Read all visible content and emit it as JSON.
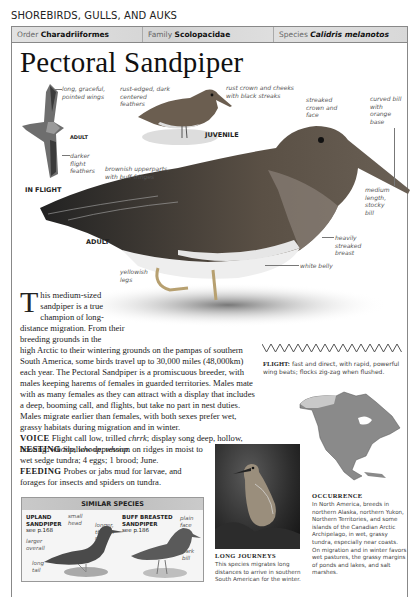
{
  "page": {
    "section_title": "SHOREBIRDS, GULLS, AND AUKS",
    "taxonomy": {
      "order_label": "Order",
      "order_value": "Charadriiformes",
      "family_label": "Family",
      "family_value": "Scolopacidae",
      "species_label": "Species",
      "species_value": "Calidris melanotos"
    },
    "species_name": "Pectoral Sandpiper"
  },
  "illustrations": {
    "flight": {
      "caption": "IN FLIGHT",
      "age": "ADULT",
      "labels": [
        "long, graceful, pointed wings",
        "darker flight feathers"
      ]
    },
    "juvenile": {
      "caption": "JUVENILE",
      "labels": [
        "rust-edged, dark centered feathers",
        "rust crown and cheeks with black streaks"
      ]
    },
    "adult": {
      "caption": "ADULT",
      "labels": {
        "upperparts": "brownish upperparts, with buff fringes",
        "crown": "streaked crown and face",
        "bill_color": "curved bill with orange base",
        "bill_shape": "medium length, stocky bill",
        "breast": "heavily streaked breast",
        "belly": "white belly",
        "legs": "yellowish legs"
      }
    }
  },
  "description": {
    "dropcap": "T",
    "intro_narrow": "his medium-sized sandpiper is a true champion of long-distance migration. From their breeding grounds in the",
    "intro_wide": "high Arctic to their wintering grounds on the pampas of southern South America, some birds travel up to 30,000 miles (48,000km) each year. The Pectoral Sandpiper is a promiscuous breeder, with males keeping harems of females in guarded territories. Males mate with as many females as they can attract with a display that includes a deep, booming call, and flights, but take no part in nest duties. Males migrate earlier than females, with both sexes prefer wet, grassy habitats during migration and in winter.",
    "voice_label": "VOICE",
    "voice_text_1": "Flight call low, trilled",
    "voice_call": "chrrk",
    "voice_text_2": "; display song deep, hollow, hooting:",
    "voice_song": "whoop, whoop, whoop.",
    "nesting_label": "NESTING",
    "nesting_text": "Shallow depression on ridges in moist to wet sedge tundra; 4 eggs; 1 brood; June.",
    "feeding_label": "FEEDING",
    "feeding_text": "Probes or jabs mud for larvae, and forages for insects and spiders on tundra."
  },
  "flight": {
    "label": "FLIGHT:",
    "text": "fast and direct, with rapid, powerful wing beats; flocks zig-zag when flushed."
  },
  "similar_species": {
    "header": "SIMILAR SPECIES",
    "species": [
      {
        "name_line1": "UPLAND",
        "name_line2": "SANDPIPER",
        "ref": "see p.168",
        "labels": [
          "small head",
          "longer, thinner neck",
          "larger overall",
          "long tail"
        ]
      },
      {
        "name_line1": "BUFF BREASTED",
        "name_line2": "SANDPIPER",
        "ref": "see p.186",
        "labels": [
          "plain face",
          "dark bill"
        ]
      }
    ]
  },
  "photo": {
    "title": "LONG JOURNEYS",
    "caption": "This species migrates long distances to arrive in southern South American for the winter."
  },
  "occurrence": {
    "title": "OCCURRENCE",
    "text": "In North America, breeds in northern Alaska, northern Yukon, Northern Territories, and some islands of the Canadian Arctic Archipelago, in wet, grassy tundra, especially near coasts. On migration and in winter favors wet pastures, the grassy margins of ponds and lakes, and salt marshes."
  }
}
